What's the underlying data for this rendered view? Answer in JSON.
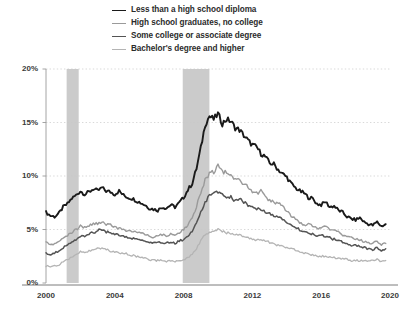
{
  "legend": {
    "position": "top-center",
    "items": [
      {
        "label": "Less than a high school diploma",
        "color": "#1a1a1a",
        "width": 1.9
      },
      {
        "label": "High school graduates, no college",
        "color": "#9a9a9a",
        "width": 1.4
      },
      {
        "label": "Some college or associate degree",
        "color": "#545454",
        "width": 1.5
      },
      {
        "label": "Bachelor's degree and higher",
        "color": "#b4b4b4",
        "width": 1.3
      }
    ]
  },
  "axes": {
    "y": {
      "label": "",
      "ticks": [
        "0%",
        "5%",
        "10%",
        "15%",
        "20%"
      ],
      "values": [
        0,
        5,
        10,
        15,
        20
      ],
      "limits": [
        0,
        20
      ],
      "grid": true
    },
    "x": {
      "label": "",
      "ticks": [
        "2000",
        "2004",
        "2008",
        "2012",
        "2016",
        "2020"
      ],
      "values": [
        2000,
        2004,
        2008,
        2012,
        2016,
        2020
      ],
      "limits": [
        2000,
        2020
      ],
      "grid": false
    }
  },
  "annotations": {
    "recession_bands": [
      {
        "start": 2001.2,
        "end": 2001.9,
        "color": "#cccccc"
      },
      {
        "start": 2007.95,
        "end": 2009.5,
        "color": "#cccccc"
      }
    ]
  },
  "chart_data": {
    "type": "line",
    "title": "",
    "subtitle": "",
    "xlabel": "",
    "ylabel": "",
    "xlim": [
      2000,
      2020
    ],
    "ylim": [
      0,
      20
    ],
    "yticks": [
      0,
      5,
      10,
      15,
      20
    ],
    "ytick_labels": [
      "0%",
      "5%",
      "10%",
      "15%",
      "20%"
    ],
    "xticks": [
      2000,
      2004,
      2008,
      2012,
      2016,
      2020
    ],
    "xtick_labels": [
      "2000",
      "2004",
      "2008",
      "2012",
      "2016",
      "2020"
    ],
    "grid": true,
    "legend_position": "top-center",
    "shaded_regions": [
      {
        "label": "recession",
        "x_start": 2001.2,
        "x_end": 2001.9
      },
      {
        "label": "recession",
        "x_start": 2007.95,
        "x_end": 2009.5
      }
    ],
    "series": [
      {
        "name": "Less than a high school diploma",
        "color": "#1a1a1a",
        "x": [
          2000.0,
          2000.25,
          2000.5,
          2000.75,
          2001.0,
          2001.25,
          2001.5,
          2001.75,
          2002.0,
          2002.25,
          2002.5,
          2002.75,
          2003.0,
          2003.25,
          2003.5,
          2003.75,
          2004.0,
          2004.25,
          2004.5,
          2004.75,
          2005.0,
          2005.25,
          2005.5,
          2005.75,
          2006.0,
          2006.25,
          2006.5,
          2006.75,
          2007.0,
          2007.25,
          2007.5,
          2007.75,
          2008.0,
          2008.25,
          2008.5,
          2008.75,
          2009.0,
          2009.25,
          2009.5,
          2009.75,
          2010.0,
          2010.25,
          2010.5,
          2010.75,
          2011.0,
          2011.25,
          2011.5,
          2011.75,
          2012.0,
          2012.25,
          2012.5,
          2012.75,
          2013.0,
          2013.25,
          2013.5,
          2013.75,
          2014.0,
          2014.25,
          2014.5,
          2014.75,
          2015.0,
          2015.25,
          2015.5,
          2015.75,
          2016.0,
          2016.25,
          2016.5,
          2016.75,
          2017.0,
          2017.25,
          2017.5,
          2017.75,
          2018.0,
          2018.25,
          2018.5,
          2018.75,
          2019.0,
          2019.25,
          2019.5,
          2019.75
        ],
        "y": [
          6.6,
          6.3,
          6.2,
          6.5,
          7.1,
          7.4,
          7.9,
          8.2,
          8.6,
          8.3,
          8.5,
          8.8,
          8.6,
          8.9,
          8.6,
          8.5,
          8.3,
          8.6,
          8.2,
          8.0,
          7.9,
          7.7,
          7.5,
          7.3,
          7.0,
          6.9,
          6.8,
          7.1,
          7.0,
          7.3,
          7.1,
          7.5,
          8.0,
          8.7,
          9.3,
          10.7,
          12.6,
          14.8,
          15.6,
          15.3,
          15.8,
          14.9,
          15.3,
          15.1,
          14.5,
          14.3,
          13.8,
          13.3,
          12.9,
          12.7,
          12.1,
          11.8,
          11.2,
          11.1,
          10.6,
          10.2,
          9.9,
          9.3,
          8.9,
          8.6,
          8.4,
          8.0,
          7.9,
          7.4,
          7.3,
          7.6,
          7.1,
          7.2,
          6.8,
          6.6,
          6.2,
          6.0,
          5.9,
          6.1,
          5.7,
          5.5,
          5.4,
          5.7,
          5.3,
          5.5
        ]
      },
      {
        "name": "High school graduates, no college",
        "color": "#9a9a9a",
        "x": [
          2000.0,
          2000.25,
          2000.5,
          2000.75,
          2001.0,
          2001.25,
          2001.5,
          2001.75,
          2002.0,
          2002.25,
          2002.5,
          2002.75,
          2003.0,
          2003.25,
          2003.5,
          2003.75,
          2004.0,
          2004.25,
          2004.5,
          2004.75,
          2005.0,
          2005.25,
          2005.5,
          2005.75,
          2006.0,
          2006.25,
          2006.5,
          2006.75,
          2007.0,
          2007.25,
          2007.5,
          2007.75,
          2008.0,
          2008.25,
          2008.5,
          2008.75,
          2009.0,
          2009.25,
          2009.5,
          2009.75,
          2010.0,
          2010.25,
          2010.5,
          2010.75,
          2011.0,
          2011.25,
          2011.5,
          2011.75,
          2012.0,
          2012.25,
          2012.5,
          2012.75,
          2013.0,
          2013.25,
          2013.5,
          2013.75,
          2014.0,
          2014.25,
          2014.5,
          2014.75,
          2015.0,
          2015.25,
          2015.5,
          2015.75,
          2016.0,
          2016.25,
          2016.5,
          2016.75,
          2017.0,
          2017.25,
          2017.5,
          2017.75,
          2018.0,
          2018.25,
          2018.5,
          2018.75,
          2019.0,
          2019.25,
          2019.5,
          2019.75
        ],
        "y": [
          3.8,
          3.6,
          3.7,
          3.9,
          4.2,
          4.4,
          4.7,
          5.0,
          5.3,
          5.2,
          5.4,
          5.5,
          5.6,
          5.7,
          5.5,
          5.4,
          5.2,
          5.1,
          5.0,
          4.9,
          4.9,
          4.8,
          4.7,
          4.6,
          4.4,
          4.3,
          4.4,
          4.5,
          4.4,
          4.6,
          4.5,
          4.7,
          5.0,
          5.4,
          6.0,
          7.2,
          8.4,
          9.7,
          10.2,
          10.4,
          10.9,
          10.4,
          10.3,
          10.0,
          9.6,
          9.6,
          9.3,
          8.9,
          8.5,
          8.4,
          8.6,
          8.1,
          7.7,
          7.5,
          7.6,
          7.1,
          6.7,
          6.2,
          6.1,
          5.7,
          5.4,
          5.5,
          5.3,
          5.1,
          5.2,
          5.3,
          5.0,
          4.9,
          4.8,
          4.5,
          4.4,
          4.2,
          4.1,
          4.0,
          3.9,
          3.8,
          3.7,
          3.9,
          3.6,
          3.7
        ]
      },
      {
        "name": "Some college or associate degree",
        "color": "#545454",
        "x": [
          2000.0,
          2000.25,
          2000.5,
          2000.75,
          2001.0,
          2001.25,
          2001.5,
          2001.75,
          2002.0,
          2002.25,
          2002.5,
          2002.75,
          2003.0,
          2003.25,
          2003.5,
          2003.75,
          2004.0,
          2004.25,
          2004.5,
          2004.75,
          2005.0,
          2005.25,
          2005.5,
          2005.75,
          2006.0,
          2006.25,
          2006.5,
          2006.75,
          2007.0,
          2007.25,
          2007.5,
          2007.75,
          2008.0,
          2008.25,
          2008.5,
          2008.75,
          2009.0,
          2009.25,
          2009.5,
          2009.75,
          2010.0,
          2010.25,
          2010.5,
          2010.75,
          2011.0,
          2011.25,
          2011.5,
          2011.75,
          2012.0,
          2012.25,
          2012.5,
          2012.75,
          2013.0,
          2013.25,
          2013.5,
          2013.75,
          2014.0,
          2014.25,
          2014.5,
          2014.75,
          2015.0,
          2015.25,
          2015.5,
          2015.75,
          2016.0,
          2016.25,
          2016.5,
          2016.75,
          2017.0,
          2017.25,
          2017.5,
          2017.75,
          2018.0,
          2018.25,
          2018.5,
          2018.75,
          2019.0,
          2019.25,
          2019.5,
          2019.75
        ],
        "y": [
          2.8,
          2.7,
          2.8,
          3.0,
          3.3,
          3.6,
          3.9,
          4.1,
          4.4,
          4.4,
          4.6,
          4.7,
          4.9,
          5.0,
          4.8,
          4.7,
          4.6,
          4.5,
          4.4,
          4.3,
          4.2,
          4.1,
          4.0,
          3.9,
          3.8,
          3.7,
          3.8,
          3.8,
          3.7,
          3.8,
          3.7,
          3.9,
          4.1,
          4.4,
          4.8,
          5.7,
          6.6,
          7.6,
          8.1,
          8.3,
          8.5,
          8.2,
          8.1,
          8.0,
          7.7,
          7.8,
          7.6,
          7.3,
          7.1,
          7.0,
          6.9,
          6.7,
          6.5,
          6.3,
          6.2,
          6.0,
          5.7,
          5.4,
          5.3,
          5.0,
          4.8,
          4.7,
          4.6,
          4.4,
          4.4,
          4.4,
          4.2,
          4.1,
          4.0,
          3.8,
          3.7,
          3.5,
          3.5,
          3.4,
          3.3,
          3.2,
          3.1,
          3.3,
          3.0,
          3.2
        ]
      },
      {
        "name": "Bachelor's degree and higher",
        "color": "#b4b4b4",
        "x": [
          2000.0,
          2000.25,
          2000.5,
          2000.75,
          2001.0,
          2001.25,
          2001.5,
          2001.75,
          2002.0,
          2002.25,
          2002.5,
          2002.75,
          2003.0,
          2003.25,
          2003.5,
          2003.75,
          2004.0,
          2004.25,
          2004.5,
          2004.75,
          2005.0,
          2005.25,
          2005.5,
          2005.75,
          2006.0,
          2006.25,
          2006.5,
          2006.75,
          2007.0,
          2007.25,
          2007.5,
          2007.75,
          2008.0,
          2008.25,
          2008.5,
          2008.75,
          2009.0,
          2009.25,
          2009.5,
          2009.75,
          2010.0,
          2010.25,
          2010.5,
          2010.75,
          2011.0,
          2011.25,
          2011.5,
          2011.75,
          2012.0,
          2012.25,
          2012.5,
          2012.75,
          2013.0,
          2013.25,
          2013.5,
          2013.75,
          2014.0,
          2014.25,
          2014.5,
          2014.75,
          2015.0,
          2015.25,
          2015.5,
          2015.75,
          2016.0,
          2016.25,
          2016.5,
          2016.75,
          2017.0,
          2017.25,
          2017.5,
          2017.75,
          2018.0,
          2018.25,
          2018.5,
          2018.75,
          2019.0,
          2019.25,
          2019.5,
          2019.75
        ],
        "y": [
          1.6,
          1.5,
          1.6,
          1.7,
          2.0,
          2.2,
          2.4,
          2.6,
          2.9,
          2.9,
          3.0,
          3.1,
          3.2,
          3.2,
          3.1,
          3.0,
          2.9,
          2.8,
          2.8,
          2.7,
          2.6,
          2.5,
          2.4,
          2.4,
          2.2,
          2.1,
          2.1,
          2.1,
          2.0,
          2.1,
          2.0,
          2.1,
          2.2,
          2.4,
          2.7,
          3.2,
          3.9,
          4.5,
          4.8,
          4.9,
          5.0,
          4.8,
          4.7,
          4.6,
          4.5,
          4.5,
          4.3,
          4.2,
          4.1,
          4.0,
          4.0,
          3.9,
          3.8,
          3.7,
          3.5,
          3.4,
          3.3,
          3.2,
          3.1,
          2.9,
          2.8,
          2.7,
          2.6,
          2.5,
          2.5,
          2.5,
          2.4,
          2.4,
          2.3,
          2.3,
          2.2,
          2.1,
          2.1,
          2.1,
          2.1,
          2.0,
          2.1,
          2.2,
          2.0,
          2.1
        ]
      }
    ]
  }
}
